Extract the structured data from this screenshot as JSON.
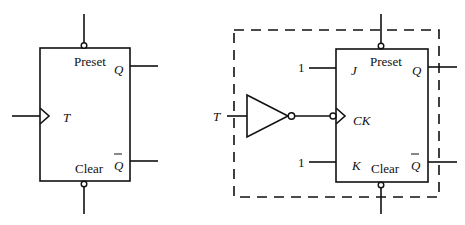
{
  "left_flipflop": {
    "type": "T flip-flop",
    "labels": {
      "preset": "Preset",
      "q": "Q",
      "t": "T",
      "q_bar": "Q",
      "clear": "Clear"
    }
  },
  "right_circuit": {
    "type": "JK flip-flop with inverted clock implementing T flip-flop",
    "labels": {
      "t_input": "T",
      "j_const": "1",
      "k_const": "1",
      "preset": "Preset",
      "j": "J",
      "q": "Q",
      "ck": "CK",
      "k": "K",
      "clear": "Clear",
      "q_bar": "Q"
    }
  }
}
